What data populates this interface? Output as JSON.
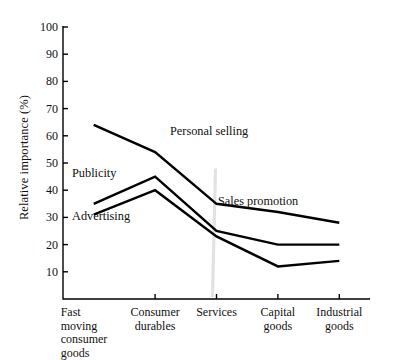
{
  "chart_data": {
    "type": "line",
    "title": "",
    "xlabel": "",
    "ylabel": "Relative importance (%)",
    "ylim": [
      0,
      100
    ],
    "ytick_values": [
      10,
      20,
      30,
      40,
      50,
      60,
      70,
      80,
      90,
      100
    ],
    "ytick_labels": [
      "10",
      "20",
      "30",
      "40",
      "50",
      "60",
      "70",
      "80",
      "90",
      "100"
    ],
    "grid": false,
    "legend_position": "inline-annotations",
    "categories": [
      "Fast moving consumer goods",
      "Consumer durables",
      "Services",
      "Capital goods",
      "Industrial goods"
    ],
    "category_lines": [
      [
        "Fast",
        "moving",
        "consumer",
        "goods"
      ],
      [
        "Consumer",
        "durables"
      ],
      [
        "Services"
      ],
      [
        "Capital",
        "goods"
      ],
      [
        "Industrial",
        "goods"
      ]
    ],
    "series": [
      {
        "name": "Personal selling",
        "color": "#000000",
        "values": [
          64,
          54,
          35,
          32,
          28
        ]
      },
      {
        "name": "Publicity",
        "color": "#000000",
        "values": [
          35,
          45,
          25,
          20,
          20
        ]
      },
      {
        "name": "Advertising",
        "color": "#000000",
        "values": [
          31,
          40,
          23,
          12,
          14
        ]
      }
    ],
    "annotations": [
      {
        "text": "Personal selling",
        "x_px": 170,
        "y_px": 125
      },
      {
        "text": "Publicity",
        "x_px": 72,
        "y_px": 167
      },
      {
        "text": "Advertising",
        "x_px": 72,
        "y_px": 210
      },
      {
        "text": "Sales promotion",
        "x_px": 218,
        "y_px": 195
      }
    ]
  },
  "axis": {
    "line_color": "#000000",
    "tick_length_px": 5
  }
}
